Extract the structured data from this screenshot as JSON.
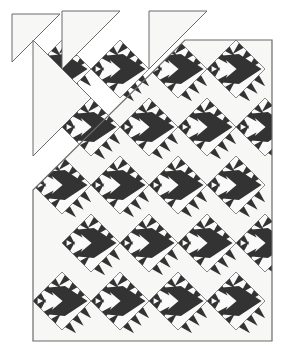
{
  "figure": {
    "kind": "quilt-pattern-diagram",
    "width": 286,
    "height": 360,
    "background_color": "#ffffff"
  },
  "palette": {
    "background": "#ffffff",
    "quilt_field": "#f7f7f5",
    "patch_dark": "#333333",
    "patch_light": "#fafafa",
    "outline": "#6b6b6b",
    "outline_dark": "#4a4a4a"
  },
  "canvas": {
    "quilt_body": {
      "left": 33,
      "top": 40,
      "right": 272,
      "bottom": 341,
      "stroke_width": 1.2
    },
    "cut_corner": {
      "description": "Upper-left of the quilt body is cut away on the diagonal; loose blocks float above it.",
      "diagonal_from": [
        33,
        190
      ],
      "diagonal_to": [
        185,
        40
      ]
    }
  },
  "grid": {
    "set": "on-point",
    "block_diagonal_px": 58,
    "half_diagonal_px": 29,
    "columns": 5,
    "rows": 6,
    "origin_x": 33,
    "origin_y": 40,
    "row_pitch_px": 29,
    "col_pitch_px": 58,
    "note": "Diamond centers alternate between full-column and half-offset rows."
  },
  "block": {
    "name": "sawtooth-arrow-diamond",
    "orientation": "arrow points right",
    "parts": [
      {
        "name": "diamond-outline",
        "role": "block border",
        "color": "#6b6b6b"
      },
      {
        "name": "arrow-body",
        "role": "dark chevron pointing right",
        "color": "#333333"
      },
      {
        "name": "left-light-triangle",
        "role": "light wedge left of chevron",
        "color": "#fafafa"
      },
      {
        "name": "upper-sawtooth",
        "role": "stepped dark triangles along upper-right edge",
        "color": "#333333",
        "steps": 3
      },
      {
        "name": "lower-sawtooth",
        "role": "stepped dark triangles along lower-right edge",
        "color": "#333333",
        "steps": 3
      },
      {
        "name": "left-sawtooth",
        "role": "stepped dark triangles along left edge",
        "color": "#333333",
        "steps": 3
      }
    ]
  },
  "blocks": [
    {
      "id": "b-01",
      "cx": 62,
      "cy": 69,
      "state": "floating-above-cut"
    },
    {
      "id": "b-02",
      "cx": 120,
      "cy": 69,
      "state": "floating-above-cut"
    },
    {
      "id": "b-03",
      "cx": 91,
      "cy": 127,
      "state": "floating-above-cut"
    },
    {
      "id": "b-04",
      "cx": 178,
      "cy": 69,
      "state": "in-body"
    },
    {
      "id": "b-05",
      "cx": 236,
      "cy": 69,
      "state": "in-body"
    },
    {
      "id": "b-06",
      "cx": 149,
      "cy": 127,
      "state": "in-body"
    },
    {
      "id": "b-07",
      "cx": 207,
      "cy": 127,
      "state": "in-body"
    },
    {
      "id": "b-08",
      "cx": 265,
      "cy": 127,
      "state": "in-body-clipped"
    },
    {
      "id": "b-09",
      "cx": 62,
      "cy": 185,
      "state": "in-body"
    },
    {
      "id": "b-10",
      "cx": 120,
      "cy": 185,
      "state": "in-body"
    },
    {
      "id": "b-11",
      "cx": 178,
      "cy": 185,
      "state": "in-body"
    },
    {
      "id": "b-12",
      "cx": 236,
      "cy": 185,
      "state": "in-body"
    },
    {
      "id": "b-13",
      "cx": 91,
      "cy": 243,
      "state": "in-body"
    },
    {
      "id": "b-14",
      "cx": 149,
      "cy": 243,
      "state": "in-body"
    },
    {
      "id": "b-15",
      "cx": 207,
      "cy": 243,
      "state": "in-body"
    },
    {
      "id": "b-16",
      "cx": 265,
      "cy": 243,
      "state": "in-body-clipped"
    },
    {
      "id": "b-17",
      "cx": 62,
      "cy": 301,
      "state": "in-body"
    },
    {
      "id": "b-18",
      "cx": 120,
      "cy": 301,
      "state": "in-body"
    },
    {
      "id": "b-19",
      "cx": 178,
      "cy": 301,
      "state": "in-body"
    },
    {
      "id": "b-20",
      "cx": 236,
      "cy": 301,
      "state": "in-body"
    }
  ],
  "loose_pieces": [
    {
      "id": "p-01",
      "name": "corner-triangle-top-left",
      "points": "12,14 60,14 12,62"
    },
    {
      "id": "p-02",
      "name": "setting-triangle-upper-left",
      "points": "33,40 91,98 33,156"
    },
    {
      "id": "p-03",
      "name": "setting-triangle-upper-mid",
      "points": "62,11 120,11 62,69"
    },
    {
      "id": "p-04",
      "name": "setting-triangle-upper-right",
      "points": "149,11 207,11 149,69"
    }
  ],
  "labels": {
    "caption": "",
    "legend": []
  }
}
